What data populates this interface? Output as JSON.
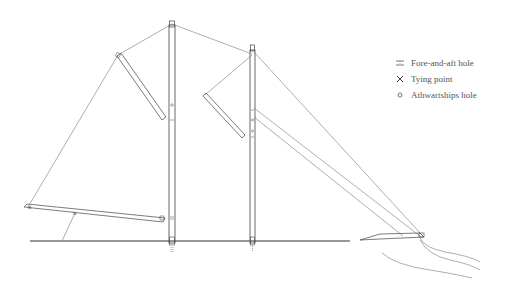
{
  "diagram": {
    "type": "rigging diagram of a two-masted sailing rig",
    "elements": {
      "main_mast": "Tall mast (left)",
      "fore_mast": "Shorter mast (right)",
      "boom": "Long lower spar with tying point",
      "gaff_left": "Upper yard on main mast",
      "gaff_right": "Upper yard on fore mast",
      "hull_bow": "Bow / bowsprit with wave lines"
    }
  },
  "legend": {
    "items": [
      {
        "symbol": "fore-and-aft-hole-icon",
        "label": "Fore-and-aft hole"
      },
      {
        "symbol": "tying-point-icon",
        "label": "Tying point"
      },
      {
        "symbol": "athwartships-hole-icon",
        "label": "Athwartships hole"
      }
    ]
  },
  "colors": {
    "ink": "#444444",
    "thin_line": "#777777",
    "background": "#ffffff"
  }
}
